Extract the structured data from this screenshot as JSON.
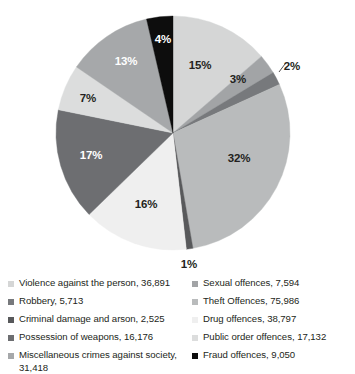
{
  "chart_data": {
    "type": "pie",
    "title": "",
    "subtitle": "",
    "xlabel": "",
    "ylabel": "",
    "legend_position": "bottom",
    "grid": false,
    "start_angle_deg": 0,
    "direction": "clockwise",
    "categories": [
      "Violence against the person",
      "Sexual offences",
      "Robbery",
      "Theft Offences",
      "Criminal damage and arson",
      "Drug offences",
      "Possession of weapons",
      "Public order offences",
      "Miscellaneous crimes against society",
      "Fraud offences"
    ],
    "values": [
      36891,
      7594,
      5713,
      75986,
      2525,
      38797,
      16176,
      17132,
      31418,
      9050
    ],
    "percent_labels": [
      "15%",
      "3%",
      "2%",
      "32%",
      "1%",
      "16%",
      "17%",
      "7%",
      "13%",
      "4%"
    ],
    "percents": [
      15,
      3,
      2,
      32,
      1,
      16,
      17,
      7,
      13,
      4
    ],
    "colors": [
      "#d5d6d6",
      "#a2a4a6",
      "#77797c",
      "#b9bbbc",
      "#58595b",
      "#efefef",
      "#6d6e71",
      "#dcdddd",
      "#a6a8aa",
      "#0d0d0d"
    ],
    "label_text_colors": [
      "dark",
      "dark",
      "dark",
      "dark",
      "dark",
      "dark",
      "light",
      "dark",
      "light",
      "light"
    ]
  },
  "slice_labels": [
    {
      "text": "15%",
      "x": 200,
      "y": 65,
      "tone": "dark"
    },
    {
      "text": "3%",
      "x": 238,
      "y": 79,
      "tone": "dark"
    },
    {
      "text": "2%",
      "x": 292,
      "y": 66,
      "tone": "dark"
    },
    {
      "text": "32%",
      "x": 239,
      "y": 158,
      "tone": "dark"
    },
    {
      "text": "1%",
      "x": 189,
      "y": 264,
      "tone": "dark"
    },
    {
      "text": "16%",
      "x": 146,
      "y": 204,
      "tone": "dark"
    },
    {
      "text": "17%",
      "x": 91,
      "y": 155,
      "tone": "light"
    },
    {
      "text": "7%",
      "x": 88,
      "y": 98,
      "tone": "dark"
    },
    {
      "text": "13%",
      "x": 126,
      "y": 61,
      "tone": "light"
    },
    {
      "text": "4%",
      "x": 163,
      "y": 39,
      "tone": "light"
    }
  ],
  "legend": {
    "left_column": [
      {
        "label": "Violence against the person, 36,891",
        "color": "#d5d6d6"
      },
      {
        "label": "Robbery, 5,713",
        "color": "#77797c"
      },
      {
        "label": "Criminal damage and arson, 2,525",
        "color": "#58595b"
      },
      {
        "label": "Possession of weapons, 16,176",
        "color": "#6d6e71"
      },
      {
        "label": "Miscellaneous crimes against society, 31,418",
        "color": "#a6a8aa"
      }
    ],
    "right_column": [
      {
        "label": "Sexual offences, 7,594",
        "color": "#a2a4a6"
      },
      {
        "label": "Theft Offences, 75,986",
        "color": "#b9bbbc"
      },
      {
        "label": "Drug offences, 38,797",
        "color": "#efefef"
      },
      {
        "label": "Public order offences, 17,132",
        "color": "#dcdddd"
      },
      {
        "label": "Fraud offences, 9,050",
        "color": "#0d0d0d"
      }
    ]
  },
  "geometry": {
    "cx": 173,
    "cy": 133,
    "r": 117
  }
}
